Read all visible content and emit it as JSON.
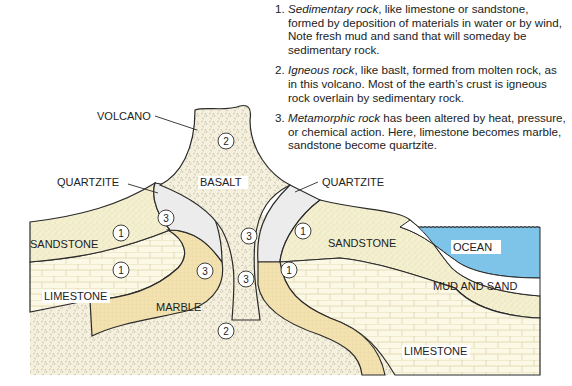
{
  "notes": [
    {
      "num": "1.",
      "term": "Sedimentary rock",
      "text": ", like limestone or sandstone, formed by deposition of materials in water or by wind, Note fresh mud and sand that will someday be sedimentary rock."
    },
    {
      "num": "2.",
      "term": "Igneous rock",
      "text": ", like baslt, formed from molten rock, as in this volcano. Most of the earth’s crust is igneous rock overlain by sedimentary rock."
    },
    {
      "num": "3.",
      "term": "Metamorphic rock",
      "text": " has been altered by heat, pressure, or chemical action. Here, limestone becomes marble, sandstone become quartzite."
    }
  ],
  "labels": {
    "volcano": "VOLCANO",
    "basalt": "BASALT",
    "quartzite_left": "QUARTZITE",
    "quartzite_right": "QUARTZITE",
    "sandstone_left": "SANDSTONE",
    "sandstone_right": "SANDSTONE",
    "limestone_left": "LIMESTONE",
    "limestone_right": "LIMESTONE",
    "marble": "MARBLE",
    "ocean": "OCEAN",
    "mud_sand": "MUD AND SAND"
  },
  "markers": {
    "igneous": "2",
    "sedimentary": "1",
    "metamorphic": "3"
  },
  "colors": {
    "sandstone": "#f3efcf",
    "limestone": "#fbf8e6",
    "marble": "#f2e2b0",
    "quartzite": "#ececec",
    "basalt": "#f2eedc",
    "ocean": "#7dc4e8",
    "outline": "#2a2a2a"
  }
}
